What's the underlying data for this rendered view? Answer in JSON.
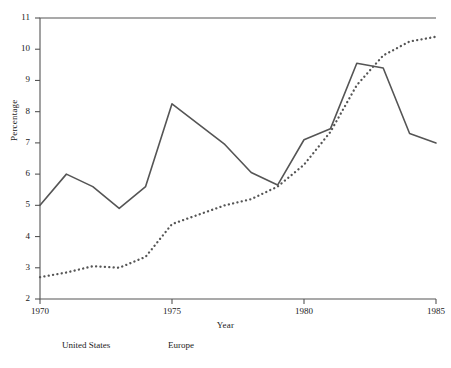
{
  "chart_data": {
    "type": "line",
    "title": "",
    "xlabel": "Year",
    "ylabel": "Percentage",
    "xlim": [
      1970,
      1985
    ],
    "ylim": [
      2,
      11
    ],
    "xticks": [
      "1970",
      "1975",
      "1980",
      "1985"
    ],
    "xtick_values": [
      1970,
      1975,
      1980,
      1985
    ],
    "yticks": [
      "2",
      "3",
      "4",
      "5",
      "6",
      "7",
      "8",
      "9",
      "10",
      "11"
    ],
    "ytick_values": [
      2,
      3,
      4,
      5,
      6,
      7,
      8,
      9,
      10,
      11
    ],
    "grid": false,
    "legend_position": "below-axis",
    "x": [
      1970,
      1971,
      1972,
      1973,
      1974,
      1975,
      1976,
      1977,
      1978,
      1979,
      1980,
      1981,
      1982,
      1983,
      1984,
      1985
    ],
    "series": [
      {
        "name": "United States",
        "style": "solid",
        "color": "#555555",
        "values": [
          5.0,
          6.0,
          5.6,
          4.9,
          5.6,
          8.25,
          7.6,
          6.95,
          6.05,
          5.65,
          7.1,
          7.45,
          9.55,
          9.4,
          7.3,
          7.0
        ]
      },
      {
        "name": "Europe",
        "style": "dotted",
        "color": "#555555",
        "values": [
          2.7,
          2.85,
          3.05,
          3.0,
          3.35,
          4.4,
          4.7,
          5.0,
          5.2,
          5.6,
          6.3,
          7.35,
          8.85,
          9.8,
          10.25,
          10.4
        ]
      }
    ]
  },
  "legend": {
    "united_states": "United States",
    "europe": "Europe"
  },
  "axes": {
    "x_title": "Year",
    "y_title": "Percentage"
  }
}
